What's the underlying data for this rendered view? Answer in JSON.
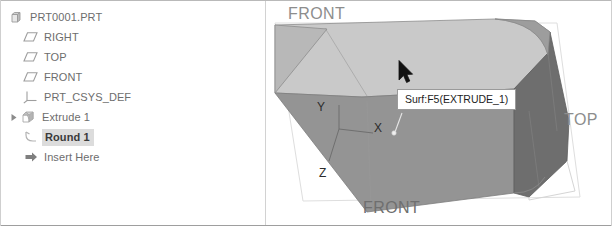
{
  "window": {
    "title": "Creo Parametric Model Tree and Graphics Window"
  },
  "model_tree": {
    "panel_name": "Model Tree",
    "items": [
      {
        "label": "PRT0001.PRT",
        "icon": "part-icon",
        "indent": 0,
        "expandable": false,
        "expanded": false,
        "selected": false
      },
      {
        "label": "RIGHT",
        "icon": "datum-plane-icon",
        "indent": 1,
        "expandable": false,
        "expanded": false,
        "selected": false
      },
      {
        "label": "TOP",
        "icon": "datum-plane-icon",
        "indent": 1,
        "expandable": false,
        "expanded": false,
        "selected": false
      },
      {
        "label": "FRONT",
        "icon": "datum-plane-icon",
        "indent": 1,
        "expandable": false,
        "expanded": false,
        "selected": false
      },
      {
        "label": "PRT_CSYS_DEF",
        "icon": "coordinate-system-icon",
        "indent": 1,
        "expandable": false,
        "expanded": false,
        "selected": false
      },
      {
        "label": "Extrude 1",
        "icon": "extrude-feature-icon",
        "indent": 1,
        "expandable": true,
        "expanded": false,
        "selected": false
      },
      {
        "label": "Round 1",
        "icon": "round-feature-icon",
        "indent": 1,
        "expandable": false,
        "expanded": false,
        "selected": true
      },
      {
        "label": "Insert Here",
        "icon": "insert-here-icon",
        "indent": 1,
        "expandable": false,
        "expanded": false,
        "selected": false
      }
    ]
  },
  "viewport": {
    "panel_name": "3D Graphics Window",
    "tooltip": {
      "text": "Surf:F5(EXTRUDE_1)"
    },
    "cursor": {
      "icon": "mouse-pointer-icon"
    },
    "datum_plane_tags": [
      {
        "label": "FRONT",
        "position": "top-left"
      },
      {
        "label": "TOP",
        "position": "right"
      },
      {
        "label": "FRONT",
        "position": "bottom-center-clipped"
      }
    ],
    "coordinate_system": {
      "name": "PRT_CSYS_DEF",
      "axes": [
        {
          "label": "Y"
        },
        {
          "label": "X"
        },
        {
          "label": "Z"
        }
      ]
    },
    "colors": {
      "top_face": "#c9c9c9",
      "front_face": "#949494",
      "right_face": "#6e6e6e",
      "left_chamfer_face": "#a5a5a5",
      "background": "#ffffff",
      "edge": "#7e7e7e",
      "datum_outline": "#d8d8d8",
      "highlight": "#dcdcdc"
    }
  }
}
